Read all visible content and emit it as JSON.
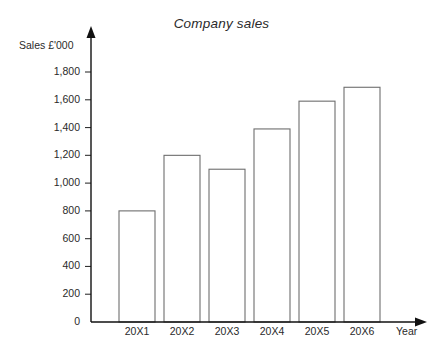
{
  "chart_data": {
    "type": "bar",
    "title": "Company sales",
    "xlabel": "Year",
    "ylabel": "Sales £'000",
    "categories": [
      "20X1",
      "20X2",
      "20X3",
      "20X4",
      "20X5",
      "20X6"
    ],
    "values": [
      800,
      1200,
      1100,
      1390,
      1590,
      1690
    ],
    "ylim": [
      0,
      1800
    ],
    "ytick_step": 200,
    "ytick_labels": [
      "0",
      "200",
      "400",
      "600",
      "800",
      "1,000",
      "1,200",
      "1,400",
      "1,600",
      "1,800"
    ],
    "ytick_values": [
      0,
      200,
      400,
      600,
      800,
      1000,
      1200,
      1400,
      1600,
      1800
    ],
    "grid": false,
    "legend": null,
    "series": [
      {
        "name": "Sales",
        "values": [
          800,
          1200,
          1100,
          1390,
          1590,
          1690
        ]
      }
    ],
    "colors": {
      "bar_fill": "#ffffff",
      "bar_stroke": "#6e6e6e",
      "axis": "#111111",
      "text": "#2a2a2a",
      "background": "#ffffff"
    },
    "axis_style": {
      "y_arrow": "up",
      "x_arrow": "right"
    }
  }
}
